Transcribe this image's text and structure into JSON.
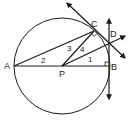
{
  "figure": {
    "type": "geometry-diagram",
    "stroke_color": "#1a1a1a",
    "background": "#ffffff"
  },
  "points": {
    "A": {
      "label": "A",
      "x": 14,
      "y": 66
    },
    "P": {
      "label": "P",
      "x": 62,
      "y": 66
    },
    "B": {
      "label": "B",
      "x": 109,
      "y": 66
    },
    "C": {
      "label": "C",
      "x": 94,
      "y": 31
    },
    "D": {
      "label": "D",
      "x": 109,
      "y": 43
    }
  },
  "angles": {
    "a1": {
      "label": "1"
    },
    "a2": {
      "label": "2"
    },
    "a3": {
      "label": "3"
    },
    "a4": {
      "label": "4"
    }
  },
  "circle": {
    "center": "P",
    "radius": 48
  },
  "right_angles": [
    "C",
    "B"
  ],
  "segments": [
    "AB",
    "AC",
    "PC",
    "PD"
  ],
  "rays_with_arrows": [
    "tangent at C through D",
    "tangent at B (vertical)",
    "PD extended"
  ]
}
